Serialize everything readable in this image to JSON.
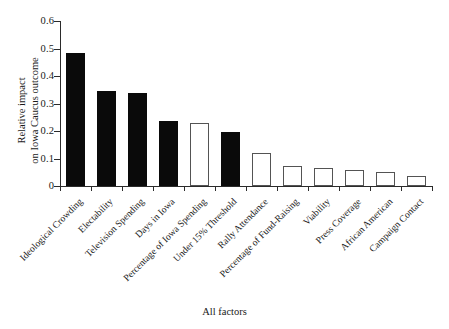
{
  "chart_data": {
    "type": "bar",
    "title": "",
    "xlabel": "All factors",
    "ylabel_lines": [
      "Relative impact",
      "on Iowa Caucus outcome"
    ],
    "ylabel": "Relative impact on Iowa Caucus outcome",
    "ylim": [
      0,
      0.6
    ],
    "ytick_labels": [
      "0.6",
      "0.5",
      "0.4",
      "0.3",
      "0.2",
      "0.1",
      "0"
    ],
    "ytick_values": [
      0.6,
      0.5,
      0.4,
      0.3,
      0.2,
      0.1,
      0
    ],
    "grid": false,
    "legend": "none",
    "categories": [
      "Ideological Crowding",
      "Electability",
      "Television Spending",
      "Days in Iowa",
      "Percentage of Iowa Spending",
      "Under 15% Threshold",
      "Rally Attendance",
      "Percentage of Fund-Raising",
      "Viability",
      "Press Coverage",
      "African American",
      "Campaign Contact"
    ],
    "values": [
      0.485,
      0.345,
      0.337,
      0.235,
      0.229,
      0.195,
      0.12,
      0.071,
      0.067,
      0.06,
      0.051,
      0.037
    ],
    "bar_styles": [
      "filled",
      "filled",
      "filled",
      "filled",
      "open",
      "filled",
      "open",
      "open",
      "open",
      "open",
      "open",
      "open"
    ],
    "colors": {
      "filled": "#0a0a0a",
      "open": "#ffffff",
      "open_edge": "#545454",
      "axis": "#2b2b2b",
      "text": "#1a1a1a",
      "background": "#ffffff"
    }
  }
}
